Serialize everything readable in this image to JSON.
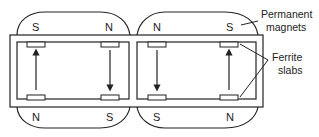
{
  "diagram": {
    "type": "ferrite phase shifter magnetic circuit",
    "magnets": [
      {
        "id": "left",
        "top_pole": "S",
        "top_right_pole": "N",
        "bottom_left_pole": "N",
        "bottom_right_pole": "S"
      },
      {
        "id": "right",
        "top_left_pole": "N",
        "top_right_pole": "S",
        "bottom_left_pole": "S",
        "bottom_right_pole": "N"
      }
    ],
    "poles": {
      "p1": "S",
      "p2": "N",
      "p3": "N",
      "p4": "S",
      "p5": "N",
      "p6": "S",
      "p7": "S",
      "p8": "N"
    },
    "labels": {
      "magnets_line1": "Permanent",
      "magnets_line2": "magnets",
      "slabs_line1": "Ferrite",
      "slabs_line2": "slabs"
    },
    "arrows": [
      {
        "position": "left-loop-left",
        "direction": "up"
      },
      {
        "position": "left-loop-right",
        "direction": "down"
      },
      {
        "position": "right-loop-left",
        "direction": "down"
      },
      {
        "position": "right-loop-right",
        "direction": "up"
      }
    ],
    "colors": {
      "stroke": "#222222",
      "background": "#ffffff"
    }
  }
}
